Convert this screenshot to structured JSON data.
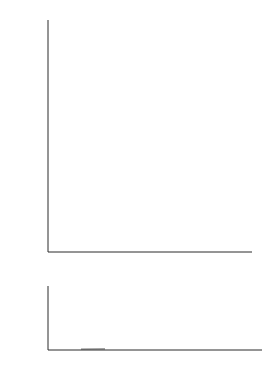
{
  "figure": {
    "name": "two-panel-plot",
    "background": "#ffffff",
    "ink_color": "#2b2b2b"
  },
  "axis_labels": {
    "y_top_parts": {
      "v1": "V",
      "sub1": "α",
      "slash1": "/",
      "v2": "V",
      "sub2": "β",
      "dot": " · ",
      "open": "[1−(",
      "v3": "V",
      "sub3": "α",
      "slash2": "/",
      "v4": "V",
      "sub4": "β",
      "close": ")",
      "pow": "3",
      "bracket": "]",
      "exp": "−1"
    },
    "y_top_plain": "Vα/Vβ · [1−(Vα/Vβ)³]⁻¹",
    "x_bottom_parts": {
      "v1": "V",
      "sub1": "α",
      "slash": " / ",
      "v2": "V",
      "sub2": "β"
    },
    "x_bottom_plain": "Vα / Vβ"
  },
  "chart_data": [
    {
      "type": "line",
      "id": "top-panel",
      "title": "",
      "xlabel": "",
      "ylabel": "Vα/Vβ · [1−(Vα/Vβ)³]⁻¹",
      "xlim": [
        0.9535,
        1.0045
      ],
      "ylim": [
        0,
        108
      ],
      "grid": false,
      "legend": null,
      "xticks": [
        0.96,
        0.97,
        0.98,
        0.99,
        1.0
      ],
      "xticklabels": [
        "0.96",
        "0.97",
        "0.98",
        "0.99",
        "1.00"
      ],
      "yticks": [
        0,
        20,
        40,
        60,
        80,
        100
      ],
      "yticklabels": [
        "0",
        "20",
        "40",
        "60",
        "80",
        "100"
      ],
      "series": [
        {
          "name": "Vα/Vβ · [1−(Vα/Vβ)³]⁻¹",
          "x": [
            0.954,
            0.956,
            0.958,
            0.96,
            0.962,
            0.964,
            0.966,
            0.968,
            0.97,
            0.972,
            0.974,
            0.976,
            0.978,
            0.98,
            0.982,
            0.984,
            0.986,
            0.988,
            0.99,
            0.991,
            0.992,
            0.993,
            0.994,
            0.995,
            0.996,
            0.997,
            0.9975,
            0.998,
            0.9983,
            0.9985
          ],
          "y": [
            7.6,
            7.9,
            8.3,
            8.7,
            9.1,
            9.6,
            10.1,
            10.7,
            11.3,
            12.0,
            12.8,
            13.7,
            14.7,
            15.8,
            17.2,
            18.8,
            20.8,
            23.2,
            26.3,
            28.2,
            30.4,
            33.1,
            36.4,
            40.5,
            45.7,
            52.6,
            57.0,
            62.4,
            66.4,
            69.4
          ]
        }
      ],
      "note": "curve drawn from start value ~11 at left axis rising to ~100 at x≈0.9985"
    },
    {
      "type": "line",
      "id": "bottom-panel",
      "title": "",
      "xlabel": "Vα / Vβ",
      "ylabel": "",
      "xlim": [
        0.0,
        1.12
      ],
      "ylim": [
        0,
        6.8
      ],
      "grid": false,
      "legend": null,
      "xticks": [
        0.2,
        0.4,
        0.6,
        0.8,
        1.0
      ],
      "xticklabels": [
        "0.2",
        "0.4",
        "0.6",
        "0.8",
        "1.0"
      ],
      "yticks": [
        0,
        2.0,
        4.0,
        6.0
      ],
      "yticklabels": [
        "0",
        "2.0",
        "4.0",
        "6.0"
      ],
      "series": [
        {
          "name": "Vα/Vβ · [1−(Vα/Vβ)³]⁻¹",
          "x": [
            0.05,
            0.1,
            0.15,
            0.2,
            0.25,
            0.3,
            0.35,
            0.4,
            0.45,
            0.5,
            0.55,
            0.6,
            0.65,
            0.7,
            0.75,
            0.8,
            0.84,
            0.87,
            0.89,
            0.91,
            0.92,
            0.93
          ],
          "y": [
            0.05,
            0.1,
            0.15,
            0.2,
            0.25,
            0.31,
            0.37,
            0.43,
            0.51,
            0.57,
            0.67,
            0.78,
            0.93,
            1.14,
            1.44,
            1.91,
            2.48,
            3.16,
            3.8,
            4.79,
            5.5,
            6.15
          ]
        }
      ]
    }
  ]
}
